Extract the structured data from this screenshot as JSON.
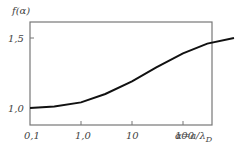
{
  "chart_data": {
    "type": "line",
    "title": "",
    "ylabel": "f(α)",
    "xlabel": "α=a/λ_D",
    "xlabel_main": "α=a/λ",
    "xlabel_sub": "D",
    "xscale": "log",
    "xlim": [
      0.1,
      1000
    ],
    "ylim": [
      0.9,
      1.6
    ],
    "x_ticks": [
      "0,1",
      "1,0",
      "10",
      "100"
    ],
    "y_ticks": [
      "1,0",
      "1,5"
    ],
    "grid": false,
    "legend": "none",
    "series": [
      {
        "name": "f(α)",
        "x": [
          0.1,
          0.3,
          1,
          3,
          10,
          30,
          100,
          300,
          1000
        ],
        "values": [
          1.0,
          1.01,
          1.04,
          1.1,
          1.19,
          1.29,
          1.39,
          1.46,
          1.5
        ]
      }
    ]
  }
}
